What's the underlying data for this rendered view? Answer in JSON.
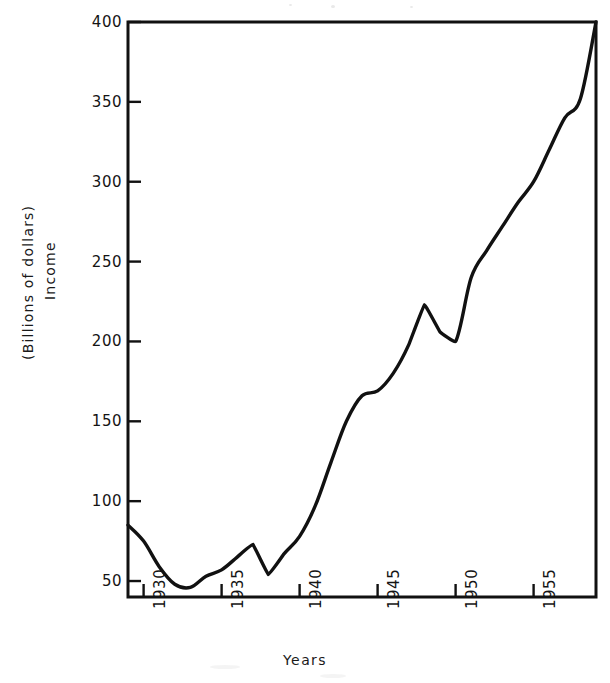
{
  "chart_data": {
    "type": "line",
    "title": "",
    "xlabel": "Years",
    "ylabel": "Income (Billions of dollars)",
    "ylabel_line1": "Income",
    "ylabel_line2": "(Billions of dollars)",
    "xlim": [
      1929,
      1959
    ],
    "ylim": [
      40,
      400
    ],
    "grid": false,
    "legend": null,
    "yticks": [
      50,
      100,
      150,
      200,
      250,
      300,
      350,
      400
    ],
    "ytick_labels": [
      "50",
      "100",
      "150",
      "200",
      "250",
      "300",
      "350",
      "400"
    ],
    "xticks": [
      1930,
      1935,
      1940,
      1945,
      1950,
      1955
    ],
    "xtick_labels": [
      "1930",
      "1935",
      "1940",
      "1945",
      "1950",
      "1955"
    ],
    "series": [
      {
        "name": "National Income",
        "color": "#111111",
        "x": [
          1929,
          1930,
          1931,
          1932,
          1933,
          1934,
          1935,
          1936,
          1937,
          1938,
          1939,
          1940,
          1941,
          1942,
          1943,
          1944,
          1945,
          1946,
          1947,
          1948,
          1949,
          1950,
          1951,
          1952,
          1953,
          1954,
          1955,
          1956,
          1957,
          1958,
          1959
        ],
        "values": [
          85,
          75,
          59,
          48,
          46,
          53,
          57,
          65,
          73,
          54,
          67,
          78,
          97,
          124,
          150,
          166,
          169,
          180,
          198,
          223,
          206,
          200,
          240,
          257,
          272,
          287,
          300,
          320,
          340,
          352,
          400
        ]
      }
    ]
  },
  "axis": {
    "frame_color": "#111111"
  }
}
